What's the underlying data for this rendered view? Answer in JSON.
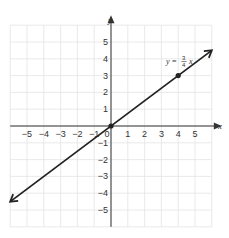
{
  "chart_data": {
    "type": "line",
    "title": "",
    "xlabel": "x",
    "ylabel": "y",
    "xlim": [
      -6,
      6
    ],
    "ylim": [
      -6,
      6
    ],
    "grid": true,
    "x_ticks": [
      -5,
      -4,
      -3,
      -2,
      -1,
      0,
      1,
      2,
      3,
      4,
      5
    ],
    "y_ticks": [
      5,
      4,
      3,
      2,
      1,
      -1,
      -2,
      -3,
      -4,
      -5
    ],
    "x_tick_labels": [
      "−5",
      "−4",
      "−3",
      "−2",
      "−1",
      "0",
      "1",
      "2",
      "3",
      "4",
      "5"
    ],
    "y_tick_labels": [
      "5",
      "4",
      "3",
      "2",
      "1",
      "−1",
      "−2",
      "−3",
      "−4",
      "−5"
    ],
    "series": [
      {
        "name": "y = 3/4 x",
        "equation": "y = (3/4)x",
        "slope": 0.75,
        "intercept": 0,
        "x": [
          -6,
          6
        ],
        "y": [
          -4.5,
          4.5
        ],
        "both_ends_arrows": true
      }
    ],
    "points": [
      {
        "x": 0,
        "y": 0,
        "marked": true
      },
      {
        "x": 4,
        "y": 3,
        "marked": true
      }
    ],
    "annotations": [
      {
        "text": "y = 3/4 x",
        "x": 3.2,
        "y": 4.1
      }
    ]
  },
  "labels": {
    "x_axis": "x",
    "y_axis": "y",
    "equation_prefix": "y =",
    "equation_num": "3",
    "equation_den": "4",
    "equation_var": "x"
  },
  "colors": {
    "grid": "#e4e4e4",
    "axis": "#333333",
    "line": "#222222"
  }
}
